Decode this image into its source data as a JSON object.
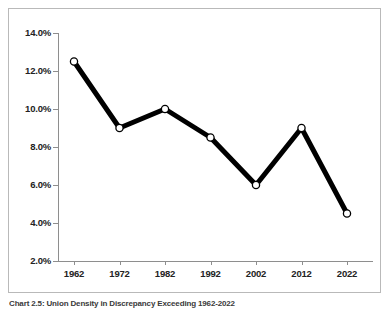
{
  "figure": {
    "caption": "Chart 2.5: Union Density in Discrepancy Exceeding 1962-2022",
    "frame_color": "#b9b9b9",
    "background": "#ffffff"
  },
  "chart_data": {
    "type": "line",
    "title": "",
    "subtitle": "",
    "xlabel": "",
    "ylabel": "",
    "categories": [
      "1962",
      "1972",
      "1982",
      "1992",
      "2002",
      "2012",
      "2022"
    ],
    "x": [
      1962,
      1972,
      1982,
      1992,
      2002,
      2012,
      2022
    ],
    "values": [
      12.5,
      9.0,
      10.0,
      8.5,
      6.0,
      9.0,
      4.5
    ],
    "series": [
      {
        "name": "",
        "values": [
          12.5,
          9.0,
          10.0,
          8.5,
          6.0,
          9.0,
          4.5
        ]
      }
    ],
    "ylim": [
      2.0,
      14.0
    ],
    "yticks": [
      2.0,
      4.0,
      6.0,
      8.0,
      10.0,
      12.0,
      14.0
    ],
    "ytick_labels": [
      "2.0%",
      "4.0%",
      "6.0%",
      "8.0%",
      "10.0%",
      "12.0%",
      "14.0%"
    ],
    "xtick_labels": [
      "1962",
      "1972",
      "1982",
      "1992",
      "2002",
      "2012",
      "2022"
    ],
    "grid": false,
    "legend": null,
    "legend_position": "none",
    "line_color": "#000000",
    "line_width": 5,
    "marker": "circle-open",
    "marker_fill": "#ffffff",
    "marker_edge_color": "#000000",
    "axis_color": "#8e8e8e",
    "tick_label_color": "#222222"
  }
}
